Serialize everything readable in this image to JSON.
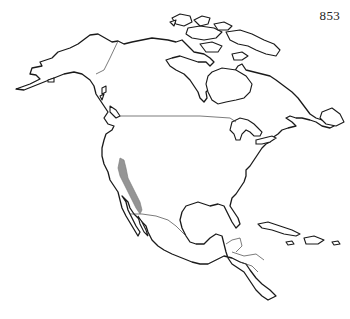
{
  "page": {
    "number": "853"
  },
  "map": {
    "region": "North America",
    "style": "outline map, black lines on white",
    "features": {
      "coastline": true,
      "political_borders": [
        "Canada–USA",
        "Alaska–Canada",
        "USA–Mexico",
        "Central America"
      ],
      "islands": [
        "Arctic Archipelago",
        "Greenland (partial)",
        "Cuba",
        "Hispaniola",
        "Jamaica",
        "Puerto Rico",
        "Vancouver Island"
      ]
    },
    "highlighted_range": {
      "label": "distribution range",
      "location": "California coast to northern Baja California",
      "color": "#8a8a8a"
    }
  }
}
